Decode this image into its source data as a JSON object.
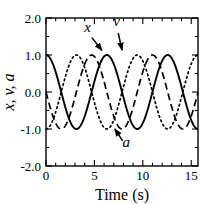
{
  "figure": {
    "background_color": "#ffffff",
    "frame_color": "#000000"
  },
  "chart_data": {
    "type": "line",
    "title": "",
    "subtitle": "",
    "xlabel": "Time (s)",
    "ylabel": "x, v, a",
    "xlim": [
      0,
      15.7
    ],
    "ylim": [
      -2.0,
      2.0
    ],
    "grid": false,
    "legend_position": "inline-annotations",
    "xticks": [
      0,
      5,
      10,
      15
    ],
    "xtick_labels": [
      "0",
      "5",
      "10",
      "15"
    ],
    "xminor_tick_interval": 1,
    "yticks": [
      -2.0,
      -1.0,
      0.0,
      1.0,
      2.0
    ],
    "ytick_labels": [
      "-2.0",
      "-1.0",
      "0.0",
      "1.0",
      "2.0"
    ],
    "yminor_tick_interval": 0.5,
    "amplitude": 1.0,
    "period": 6.28,
    "angular_frequency": 1.0,
    "series": [
      {
        "name": "x",
        "label": "x",
        "line_style": "solid",
        "color": "#000000",
        "function": "cos(t)",
        "phase_deg": 0,
        "x": [
          0,
          0.5,
          1,
          1.5,
          2,
          2.5,
          3,
          3.5,
          4,
          4.5,
          5,
          5.5,
          6,
          6.5,
          7,
          7.5,
          8,
          8.5,
          9,
          9.5,
          10,
          10.5,
          11,
          11.5,
          12,
          12.5,
          13,
          13.5,
          14,
          14.5,
          15,
          15.7
        ],
        "values": [
          1.0,
          0.88,
          0.54,
          0.07,
          -0.42,
          -0.8,
          -0.99,
          -0.94,
          -0.65,
          -0.21,
          0.28,
          0.71,
          0.96,
          0.98,
          0.75,
          0.35,
          -0.15,
          -0.6,
          -0.91,
          -1.0,
          -0.84,
          -0.48,
          0.0,
          0.48,
          0.84,
          1.0,
          0.91,
          0.6,
          0.15,
          -0.35,
          -0.76,
          -1.0
        ]
      },
      {
        "name": "v",
        "label": "v",
        "line_style": "dashed",
        "color": "#000000",
        "function": "cos(t + 90deg)",
        "phase_deg": 90,
        "x": [
          0,
          0.5,
          1,
          1.5,
          2,
          2.5,
          3,
          3.5,
          4,
          4.5,
          5,
          5.5,
          6,
          6.5,
          7,
          7.5,
          8,
          8.5,
          9,
          9.5,
          10,
          10.5,
          11,
          11.5,
          12,
          12.5,
          13,
          13.5,
          14,
          14.5,
          15,
          15.7
        ],
        "values": [
          0.0,
          0.48,
          0.84,
          1.0,
          0.91,
          0.6,
          0.14,
          -0.35,
          -0.76,
          -0.98,
          -0.96,
          -0.71,
          -0.28,
          0.22,
          0.66,
          0.94,
          0.99,
          0.8,
          0.41,
          -0.07,
          -0.54,
          -0.88,
          -1.0,
          -0.88,
          -0.54,
          -0.07,
          0.42,
          0.8,
          0.99,
          0.94,
          0.65,
          0.01
        ]
      },
      {
        "name": "a",
        "label": "a",
        "line_style": "dotted",
        "color": "#000000",
        "function": "cos(t + 180deg)",
        "phase_deg": 180,
        "x": [
          0,
          0.5,
          1,
          1.5,
          2,
          2.5,
          3,
          3.5,
          4,
          4.5,
          5,
          5.5,
          6,
          6.5,
          7,
          7.5,
          8,
          8.5,
          9,
          9.5,
          10,
          10.5,
          11,
          11.5,
          12,
          12.5,
          13,
          13.5,
          14,
          14.5,
          15,
          15.7
        ],
        "values": [
          -1.0,
          -0.88,
          -0.54,
          -0.07,
          0.42,
          0.8,
          0.99,
          0.94,
          0.65,
          0.21,
          -0.28,
          -0.71,
          -0.96,
          -0.98,
          -0.75,
          -0.35,
          0.15,
          0.6,
          0.91,
          1.0,
          0.84,
          0.48,
          0.0,
          -0.48,
          -0.84,
          -1.0,
          -0.91,
          -0.6,
          -0.15,
          0.35,
          0.76,
          1.0
        ]
      }
    ],
    "annotations": [
      {
        "text": "x",
        "target_series": "x",
        "label_t": 4.3,
        "label_y": 1.62,
        "arrow_to_t": 5.9,
        "arrow_to_y": 1.08
      },
      {
        "text": "v",
        "target_series": "v",
        "label_t": 7.3,
        "label_y": 1.78,
        "arrow_to_t": 7.9,
        "arrow_to_y": 1.08
      },
      {
        "text": "a",
        "target_series": "a",
        "label_t": 8.3,
        "label_y": -1.48,
        "arrow_to_t": 7.0,
        "arrow_to_y": -0.95
      }
    ]
  }
}
